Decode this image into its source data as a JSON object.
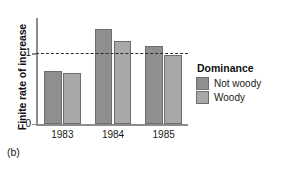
{
  "panel": {
    "tag": "(b)"
  },
  "chart_data": {
    "type": "bar",
    "title": "",
    "xlabel": "",
    "ylabel": "Finite rate of increase",
    "categories": [
      "1983",
      "1984",
      "1985"
    ],
    "series": [
      {
        "name": "Not woody",
        "color": "#8f8f8f",
        "values": [
          0.75,
          1.34,
          1.1
        ]
      },
      {
        "name": "Woody",
        "color": "#a8a8a8",
        "values": [
          0.72,
          1.17,
          0.97
        ]
      }
    ],
    "ylim": [
      0,
      1.5
    ],
    "ytick_labels": [
      "0",
      "1"
    ],
    "ytick_values": [
      0,
      1
    ],
    "grid": false,
    "reference_line": {
      "value": 1,
      "style": "dashed",
      "color": "#2b2b2b"
    },
    "legend": {
      "title": "Dominance",
      "position": "right",
      "entries": [
        "Not woody",
        "Woody"
      ]
    }
  }
}
